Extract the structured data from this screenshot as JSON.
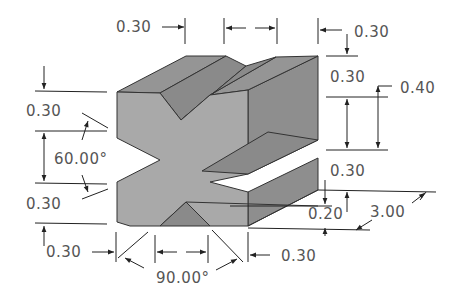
{
  "drawing": {
    "title": "Isometric X-block with V-grooves",
    "colors": {
      "background": "#ffffff",
      "front_face": "#a9a9a9",
      "top_face": "#959595",
      "side_face": "#8e8e8e",
      "line": "#222222",
      "text": "#555555"
    },
    "dimensions": {
      "top_left_width": "0.30",
      "top_right_width": "0.30",
      "right_upper_height": "0.30",
      "right_slot_height": "0.40",
      "right_lower_height": "0.30",
      "right_base_height": "0.20",
      "depth": "3.00",
      "left_upper_height": "0.30",
      "left_angle": "60.00°",
      "left_lower_height": "0.30",
      "bottom_left_width": "0.30",
      "bottom_right_width": "0.30",
      "bottom_angle": "90.00°"
    }
  }
}
